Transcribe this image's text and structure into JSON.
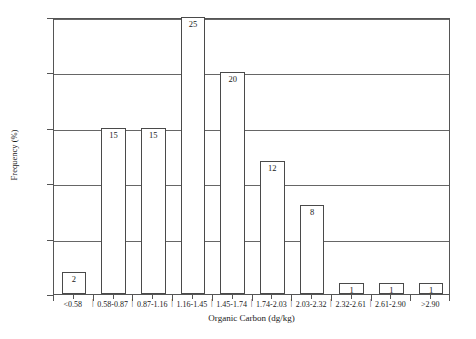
{
  "chart_data": {
    "type": "bar",
    "title": "",
    "subtitle": "",
    "xlabel": "Organic Carbon (dg/kg)",
    "ylabel": "Frequency (%)",
    "ylim": [
      0,
      25
    ],
    "yticks": [
      0,
      5,
      10,
      15,
      20,
      25
    ],
    "ytick_labels": [
      "0",
      "5",
      "10",
      "15",
      "20",
      "25"
    ],
    "grid": true,
    "legend": null,
    "categories": [
      "<0.58",
      "0.58-0.87",
      "0.87-1.16",
      "1.16-1.45",
      "1.45-1.74",
      "1.74-2.03",
      "2.03-2.32",
      "2.32-2.61",
      "2.61-2.90",
      ">2.90"
    ],
    "values": [
      2,
      15,
      15,
      25,
      20,
      12,
      8,
      1,
      1,
      1
    ],
    "value_labels": [
      "2",
      "15",
      "15",
      "25",
      "20",
      "12",
      "8",
      "1",
      "1",
      "1"
    ],
    "bar_style": {
      "fill": "#ffffff",
      "edge": "#4a4a4a",
      "label_position": "inside-top-center"
    },
    "axis_color": "#555555",
    "grid_color": "#666666",
    "separator_glyph": "|"
  }
}
